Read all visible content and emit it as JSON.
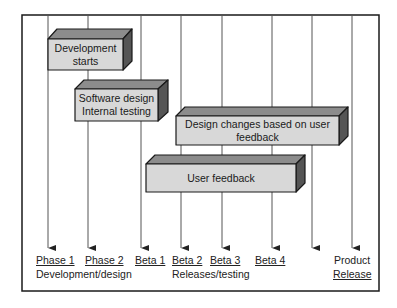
{
  "colors": {
    "front_face": "#d8d8d8",
    "top_face": "#8c8c8c",
    "side_face": "#555555",
    "border": "#1a1a1a",
    "line": "#555555"
  },
  "boxes": [
    {
      "line1": "Development",
      "line2": "starts"
    },
    {
      "line1": "Software design",
      "line2": "Internal testing"
    },
    {
      "line1": "Design changes based on user",
      "line2": "feedback"
    },
    {
      "line1": "User feedback",
      "line2": ""
    }
  ],
  "milestones": [
    {
      "label": "Phase 1"
    },
    {
      "label": "Phase 2"
    },
    {
      "label": "Beta 1"
    },
    {
      "label": "Beta 2"
    },
    {
      "label": "Beta 3"
    },
    {
      "label": "Beta 4"
    },
    {
      "label": "Product",
      "label2": "Release"
    }
  ],
  "groups": [
    {
      "label": "Development/design"
    },
    {
      "label": "Releases/testing"
    }
  ]
}
